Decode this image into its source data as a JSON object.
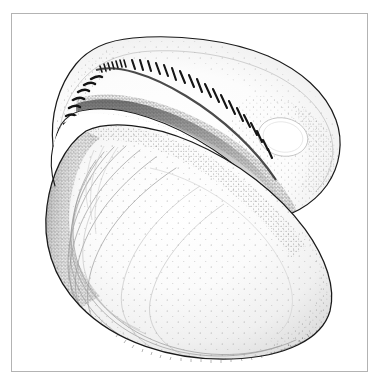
{
  "figure": {
    "kind": "scientific-line-illustration",
    "technique": "pen-and-ink stipple with outline",
    "background_color": "#ffffff",
    "ink_color": "#1a1a1a",
    "stipple_color": "#595959",
    "growth_line_color": "#8c8c8c",
    "canvas": {
      "width": 383,
      "height": 385
    }
  },
  "frame": {
    "name": "border-frame",
    "color": "#b0b0b0",
    "stroke_width": 1,
    "x": 11,
    "y": 13,
    "width": 357,
    "height": 359
  },
  "upper_valve": {
    "label": "upper-valve-interior",
    "outline_color": "#1a1a1a",
    "fill_color": "#ffffff",
    "outline_path": "M 53 146 C 50 116, 58 86, 76 64 C 90 47, 110 40, 133 38 C 178 34, 230 40, 268 56 C 300 70, 326 92, 336 120 C 344 142, 340 166, 327 185 C 312 206, 288 218, 268 219 C 262 194, 240 168, 208 148 C 168 123, 118 111, 82 114 C 68 116, 58 128, 53 146 Z",
    "inner_margin_path": "M 60 144 C 58 118, 68 94, 86 76 C 102 60, 126 52, 152 51 C 196 49, 243 58, 277 76 C 305 91, 325 112, 331 136 C 336 156, 330 176, 317 190",
    "hinge_teeth": {
      "label": "taxodont-hinge-teeth",
      "count": 27,
      "description": "row of short dark vertical bars following the dorsal hinge line"
    },
    "muscle_scars": [
      {
        "label": "anterior-adductor-muscle-scar",
        "cx": 82,
        "cy": 143,
        "rx": 17,
        "ry": 14,
        "rotation": -20
      },
      {
        "label": "posterior-adductor-muscle-scar",
        "cx": 283,
        "cy": 137,
        "rx": 25,
        "ry": 19,
        "rotation": 12
      }
    ]
  },
  "lower_valve": {
    "label": "lower-valve-exterior",
    "outline_color": "#1a1a1a",
    "fill_color": "#ffffff",
    "outline_path": "M 86 131 C 108 120, 150 124, 192 142 C 238 162, 278 193, 305 229 C 326 258, 336 288, 330 311 C 322 339, 286 357, 232 359 C 170 361, 114 341, 80 306 C 52 277, 42 241, 47 206 C 51 176, 64 146, 86 131 Z",
    "umbo": {
      "label": "umbo-beak",
      "x": 86,
      "y": 131
    },
    "growth_lines": {
      "label": "concentric-growth-lines",
      "count": 11,
      "description": "fine concentric arcs paralleling the ventral margin"
    }
  },
  "accessibility": {
    "title": "Bivalve shell, interior hinge view",
    "role": "img"
  }
}
